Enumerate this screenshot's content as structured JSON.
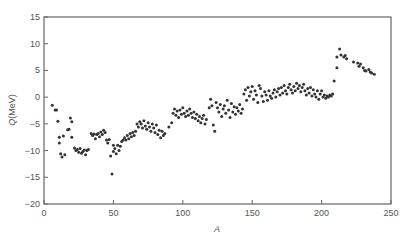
{
  "chart_data": {
    "type": "scatter",
    "title": "",
    "xlabel": "A",
    "ylabel": "Q",
    "ylabel_unit": "(MeV)",
    "xlim": [
      0,
      250
    ],
    "ylim": [
      -20,
      15
    ],
    "xticks": [
      0,
      50,
      100,
      150,
      200,
      250
    ],
    "yticks": [
      -20,
      -15,
      -10,
      -5,
      0,
      5,
      10,
      15
    ],
    "grid": false,
    "legend": null,
    "marker_color": "#333333",
    "series": [
      {
        "name": "Q-value",
        "points": [
          [
            6,
            -1.5
          ],
          [
            8,
            -2.4
          ],
          [
            9,
            -2.4
          ],
          [
            10,
            -4.5
          ],
          [
            11,
            -7.5
          ],
          [
            11,
            -8.6
          ],
          [
            12,
            -10.6
          ],
          [
            13,
            -11.2
          ],
          [
            14,
            -7.3
          ],
          [
            15,
            -10.8
          ],
          [
            17,
            -6.1
          ],
          [
            18,
            -6.0
          ],
          [
            19,
            -3.9
          ],
          [
            20,
            -4.6
          ],
          [
            20,
            -7.5
          ],
          [
            22,
            -9.5
          ],
          [
            23,
            -10.0
          ],
          [
            24,
            -9.8
          ],
          [
            25,
            -10.3
          ],
          [
            26,
            -9.6
          ],
          [
            27,
            -10.5
          ],
          [
            28,
            -10.2
          ],
          [
            29,
            -9.9
          ],
          [
            30,
            -10.8
          ],
          [
            31,
            -10.0
          ],
          [
            32,
            -9.8
          ],
          [
            34,
            -6.8
          ],
          [
            35,
            -7.2
          ],
          [
            36,
            -6.9
          ],
          [
            37,
            -7.8
          ],
          [
            38,
            -7.0
          ],
          [
            39,
            -6.8
          ],
          [
            40,
            -7.4
          ],
          [
            41,
            -6.5
          ],
          [
            42,
            -7.0
          ],
          [
            43,
            -6.2
          ],
          [
            44,
            -6.6
          ],
          [
            45,
            -8.0
          ],
          [
            46,
            -8.6
          ],
          [
            47,
            -7.9
          ],
          [
            48,
            -11.0
          ],
          [
            49,
            -14.4
          ],
          [
            50,
            -9.0
          ],
          [
            50,
            -10.2
          ],
          [
            51,
            -9.6
          ],
          [
            52,
            -10.6
          ],
          [
            53,
            -9.0
          ],
          [
            54,
            -10.0
          ],
          [
            55,
            -9.2
          ],
          [
            56,
            -8.3
          ],
          [
            57,
            -8.0
          ],
          [
            58,
            -7.6
          ],
          [
            59,
            -8.0
          ],
          [
            60,
            -7.2
          ],
          [
            61,
            -7.8
          ],
          [
            62,
            -6.8
          ],
          [
            63,
            -7.4
          ],
          [
            64,
            -6.6
          ],
          [
            65,
            -7.2
          ],
          [
            66,
            -6.4
          ],
          [
            67,
            -5.0
          ],
          [
            68,
            -5.6
          ],
          [
            69,
            -4.6
          ],
          [
            70,
            -5.0
          ],
          [
            71,
            -5.8
          ],
          [
            72,
            -4.4
          ],
          [
            73,
            -5.4
          ],
          [
            74,
            -6.0
          ],
          [
            75,
            -4.8
          ],
          [
            76,
            -5.6
          ],
          [
            77,
            -6.4
          ],
          [
            78,
            -5.0
          ],
          [
            79,
            -5.8
          ],
          [
            80,
            -6.6
          ],
          [
            81,
            -5.2
          ],
          [
            82,
            -7.0
          ],
          [
            83,
            -6.2
          ],
          [
            84,
            -7.6
          ],
          [
            85,
            -6.4
          ],
          [
            86,
            -7.2
          ],
          [
            87,
            -6.8
          ],
          [
            90,
            -5.6
          ],
          [
            92,
            -4.8
          ],
          [
            93,
            -3.0
          ],
          [
            94,
            -2.2
          ],
          [
            95,
            -3.4
          ],
          [
            96,
            -2.6
          ],
          [
            97,
            -3.8
          ],
          [
            98,
            -2.4
          ],
          [
            99,
            -3.2
          ],
          [
            100,
            -2.0
          ],
          [
            101,
            -3.0
          ],
          [
            102,
            -3.6
          ],
          [
            103,
            -2.6
          ],
          [
            104,
            -3.4
          ],
          [
            105,
            -2.2
          ],
          [
            106,
            -3.0
          ],
          [
            107,
            -3.8
          ],
          [
            108,
            -2.8
          ],
          [
            109,
            -4.0
          ],
          [
            110,
            -3.2
          ],
          [
            111,
            -4.4
          ],
          [
            112,
            -3.6
          ],
          [
            113,
            -4.8
          ],
          [
            114,
            -4.0
          ],
          [
            115,
            -3.4
          ],
          [
            116,
            -5.0
          ],
          [
            117,
            -4.2
          ],
          [
            119,
            -2.0
          ],
          [
            120,
            -0.4
          ],
          [
            121,
            -1.6
          ],
          [
            122,
            -5.2
          ],
          [
            123,
            -6.4
          ],
          [
            124,
            -1.0
          ],
          [
            125,
            -2.0
          ],
          [
            126,
            -2.8
          ],
          [
            127,
            -1.4
          ],
          [
            128,
            -3.6
          ],
          [
            129,
            -2.2
          ],
          [
            130,
            -1.6
          ],
          [
            131,
            -3.0
          ],
          [
            132,
            -0.6
          ],
          [
            133,
            -2.4
          ],
          [
            134,
            -3.8
          ],
          [
            135,
            -1.2
          ],
          [
            136,
            -2.8
          ],
          [
            137,
            -1.8
          ],
          [
            138,
            -3.2
          ],
          [
            139,
            -2.0
          ],
          [
            140,
            -2.6
          ],
          [
            141,
            -1.4
          ],
          [
            142,
            -3.0
          ],
          [
            143,
            -2.2
          ],
          [
            144,
            0.6
          ],
          [
            145,
            1.4
          ],
          [
            146,
            -0.6
          ],
          [
            147,
            1.8
          ],
          [
            148,
            0.2
          ],
          [
            149,
            1.0
          ],
          [
            150,
            2.0
          ],
          [
            151,
            -0.4
          ],
          [
            152,
            1.2
          ],
          [
            153,
            0.4
          ],
          [
            154,
            -1.0
          ],
          [
            155,
            2.2
          ],
          [
            156,
            1.6
          ],
          [
            157,
            0.2
          ],
          [
            158,
            -0.8
          ],
          [
            159,
            1.0
          ],
          [
            160,
            0.4
          ],
          [
            161,
            -0.6
          ],
          [
            162,
            1.2
          ],
          [
            163,
            0.2
          ],
          [
            164,
            -0.2
          ],
          [
            165,
            0.8
          ],
          [
            166,
            1.4
          ],
          [
            167,
            0.0
          ],
          [
            168,
            1.0
          ],
          [
            169,
            1.6
          ],
          [
            170,
            0.4
          ],
          [
            171,
            1.8
          ],
          [
            172,
            0.8
          ],
          [
            173,
            2.2
          ],
          [
            174,
            1.2
          ],
          [
            175,
            0.6
          ],
          [
            176,
            1.8
          ],
          [
            177,
            2.4
          ],
          [
            178,
            1.4
          ],
          [
            179,
            0.8
          ],
          [
            180,
            2.0
          ],
          [
            181,
            1.2
          ],
          [
            182,
            2.6
          ],
          [
            183,
            1.6
          ],
          [
            184,
            2.2
          ],
          [
            185,
            1.0
          ],
          [
            186,
            1.8
          ],
          [
            187,
            2.4
          ],
          [
            188,
            1.2
          ],
          [
            189,
            0.4
          ],
          [
            190,
            1.6
          ],
          [
            191,
            0.8
          ],
          [
            192,
            1.8
          ],
          [
            193,
            0.2
          ],
          [
            194,
            1.4
          ],
          [
            195,
            0.6
          ],
          [
            196,
            0.0
          ],
          [
            197,
            1.2
          ],
          [
            198,
            -0.4
          ],
          [
            199,
            0.6
          ],
          [
            200,
            1.2
          ],
          [
            201,
            0.0
          ],
          [
            202,
            0.4
          ],
          [
            203,
            -0.2
          ],
          [
            204,
            0.2
          ],
          [
            205,
            0.0
          ],
          [
            206,
            0.4
          ],
          [
            207,
            0.2
          ],
          [
            208,
            0.6
          ],
          [
            209,
            3.0
          ],
          [
            211,
            5.5
          ],
          [
            211,
            7.5
          ],
          [
            213,
            9.0
          ],
          [
            214,
            7.9
          ],
          [
            216,
            7.5
          ],
          [
            217,
            7.8
          ],
          [
            218,
            7.2
          ],
          [
            223,
            6.6
          ],
          [
            226,
            6.4
          ],
          [
            227,
            5.8
          ],
          [
            228,
            6.2
          ],
          [
            230,
            5.5
          ],
          [
            231,
            5.0
          ],
          [
            232,
            4.9
          ],
          [
            234,
            5.2
          ],
          [
            235,
            4.7
          ],
          [
            236,
            4.5
          ],
          [
            238,
            4.3
          ]
        ]
      }
    ]
  }
}
